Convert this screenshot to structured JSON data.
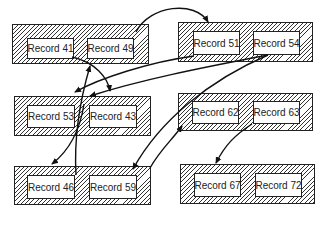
{
  "blocks": [
    {
      "id": "A",
      "x": 12,
      "y": 24,
      "w": 137,
      "h": 40,
      "records": [
        {
          "label": "Record 41",
          "x": 14,
          "y": 13,
          "w": 47,
          "h": 21
        },
        {
          "label": "Record 49",
          "x": 74,
          "y": 13,
          "w": 47,
          "h": 21
        }
      ]
    },
    {
      "id": "B",
      "x": 178,
      "y": 22,
      "w": 135,
      "h": 40,
      "records": [
        {
          "label": "Record 51",
          "x": 14,
          "y": 8,
          "w": 47,
          "h": 24
        },
        {
          "label": "Record 54",
          "x": 74,
          "y": 8,
          "w": 47,
          "h": 24
        }
      ]
    },
    {
      "id": "C",
      "x": 14,
      "y": 96,
      "w": 137,
      "h": 40,
      "records": [
        {
          "label": "Record 53",
          "x": 12,
          "y": 8,
          "w": 48,
          "h": 23
        },
        {
          "label": "Record 43",
          "x": 74,
          "y": 8,
          "w": 48,
          "h": 23
        }
      ]
    },
    {
      "id": "D",
      "x": 178,
      "y": 93,
      "w": 135,
      "h": 38,
      "records": [
        {
          "label": "Record 62",
          "x": 13,
          "y": 7,
          "w": 47,
          "h": 23
        },
        {
          "label": "Record 63",
          "x": 74,
          "y": 7,
          "w": 47,
          "h": 23
        }
      ]
    },
    {
      "id": "E",
      "x": 14,
      "y": 166,
      "w": 137,
      "h": 39,
      "records": [
        {
          "label": "Record 46",
          "x": 12,
          "y": 8,
          "w": 48,
          "h": 24
        },
        {
          "label": "Record 59",
          "x": 74,
          "y": 8,
          "w": 48,
          "h": 24
        }
      ]
    },
    {
      "id": "F",
      "x": 180,
      "y": 164,
      "w": 135,
      "h": 40,
      "records": [
        {
          "label": "Record 67",
          "x": 13,
          "y": 8,
          "w": 47,
          "h": 24
        },
        {
          "label": "Record 72",
          "x": 74,
          "y": 8,
          "w": 47,
          "h": 24
        }
      ]
    }
  ],
  "arrows": [
    {
      "from": "Record 49",
      "to": "Block B",
      "d": "M 136 32 C 150 5, 195 0, 208 22"
    },
    {
      "from": "Record 41",
      "to": "Block C",
      "d": "M 72 57 C 95 62, 108 78, 110 91"
    },
    {
      "from": "Record 51",
      "to": "Block C",
      "d": "M 194 56 C 150 62, 100 78, 75 92"
    },
    {
      "from": "Record 54",
      "to": "Block E (Record 59)",
      "d": "M 268 55 C 210 80, 160 120, 133 169"
    },
    {
      "from": "Record 54",
      "to": "Block C (Record 43)",
      "d": "M 268 55 C 200 68, 140 80, 90 96"
    },
    {
      "from": "Record 43",
      "to": "Block E",
      "d": "M 84 104 C 80 130, 70 150, 52 164"
    },
    {
      "from": "Record 46",
      "to": "Block A (Record 41)",
      "d": "M 76 175 C 74 140, 80 100, 90 66"
    },
    {
      "from": "Record 59",
      "to": "Block D",
      "d": "M 150 168 C 160 150, 172 140, 182 126"
    },
    {
      "from": "Record 63",
      "to": "Block F",
      "d": "M 252 124 C 235 135, 225 145, 216 163"
    }
  ]
}
